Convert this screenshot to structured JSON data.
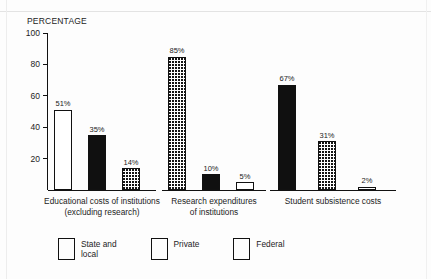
{
  "chart_data": {
    "type": "bar",
    "title": "",
    "ylabel": "PERCENTAGE",
    "xlabel": "",
    "ylim": [
      0,
      100
    ],
    "yticks": [
      {
        "value": 100,
        "label": "100"
      },
      {
        "value": 80,
        "label": "80"
      },
      {
        "value": 60,
        "label": "60"
      },
      {
        "value": 40,
        "label": "40"
      },
      {
        "value": 20,
        "label": "20"
      }
    ],
    "grid": false,
    "legend_position": "bottom-left",
    "legend": [
      {
        "name": "State and local",
        "fill": "white",
        "color": "#ffffff"
      },
      {
        "name": "Private",
        "fill": "black",
        "color": "#101010"
      },
      {
        "name": "Federal",
        "fill": "dotted",
        "color": "#ffffff"
      }
    ],
    "categories": [
      "Educational costs of institutions (excluding research)",
      "Research expenditures of institutions",
      "Student subsistence costs"
    ],
    "series": [
      {
        "name": "State and local",
        "values": [
          51,
          5,
          2
        ]
      },
      {
        "name": "Private",
        "values": [
          35,
          10,
          67
        ]
      },
      {
        "name": "Federal",
        "values": [
          14,
          85,
          31
        ]
      }
    ],
    "groups": [
      {
        "id": "educational-costs",
        "label_line1": "Educational costs of institutions",
        "label_line2": "(excluding research)",
        "bars": [
          {
            "series": "State and local",
            "value": 51,
            "value_label": "51%",
            "fill": "white"
          },
          {
            "series": "Private",
            "value": 35,
            "value_label": "35%",
            "fill": "black"
          },
          {
            "series": "Federal",
            "value": 14,
            "value_label": "14%",
            "fill": "dotted"
          }
        ]
      },
      {
        "id": "research-expenditures",
        "label_line1": "Research expenditures",
        "label_line2": "of institutions",
        "bars": [
          {
            "series": "Federal",
            "value": 85,
            "value_label": "85%",
            "fill": "dotted"
          },
          {
            "series": "Private",
            "value": 10,
            "value_label": "10%",
            "fill": "black"
          },
          {
            "series": "State and local",
            "value": 5,
            "value_label": "5%",
            "fill": "white"
          }
        ]
      },
      {
        "id": "student-subsistence",
        "label_line1": "Student subsistence costs",
        "label_line2": "",
        "bars": [
          {
            "series": "Private",
            "value": 67,
            "value_label": "67%",
            "fill": "black"
          },
          {
            "series": "Federal",
            "value": 31,
            "value_label": "31%",
            "fill": "dotted"
          },
          {
            "series": "State and local",
            "value": 2,
            "value_label": "2%",
            "fill": "white"
          }
        ]
      }
    ]
  },
  "legend": {
    "items": [
      {
        "label_line1": "State and",
        "label_line2": "local"
      },
      {
        "label_line1": "Private",
        "label_line2": ""
      },
      {
        "label_line1": "Federal",
        "label_line2": ""
      }
    ]
  }
}
